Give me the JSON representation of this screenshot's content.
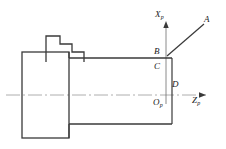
{
  "figure": {
    "background_color": "#ffffff",
    "line_color": "#3a3a3a",
    "centerline_color": "#9a9a9a",
    "text_color": "#1a1a1a"
  },
  "axes": {
    "vertical": {
      "name": "X_p",
      "letter": "X",
      "subscript": "p",
      "x": 166,
      "y_top": 22,
      "y_bottom": 104,
      "arrow": "up"
    },
    "horizontal": {
      "name": "Z_p",
      "letter": "Z",
      "subscript": "p",
      "y": 95,
      "x_left": 6,
      "x_right": 206,
      "arrow": "right"
    },
    "origin": {
      "name": "O_p",
      "letter": "O",
      "subscript": "p",
      "x": 166,
      "y": 95
    }
  },
  "points": [
    {
      "id": "A",
      "label": "A",
      "x": 205,
      "y": 23
    },
    {
      "id": "B",
      "label": "B",
      "x": 166,
      "y": 57
    },
    {
      "id": "C",
      "label": "C",
      "x": 166,
      "y": 66
    },
    {
      "id": "D",
      "label": "D",
      "x": 166,
      "y": 84
    }
  ],
  "labels": {
    "axis_x": {
      "letter": "X",
      "subscript": "p",
      "left": 155,
      "top": 10
    },
    "axis_z": {
      "letter": "Z",
      "subscript": "p",
      "left": 192,
      "top": 96
    },
    "origin": {
      "letter": "O",
      "subscript": "p",
      "left": 153,
      "top": 98
    },
    "point_a": {
      "text": "A",
      "left": 204,
      "top": 15
    },
    "point_b": {
      "text": "B",
      "left": 154,
      "top": 47
    },
    "point_c": {
      "text": "C",
      "left": 154,
      "top": 62
    },
    "point_d": {
      "text": "D",
      "left": 172,
      "top": 80
    }
  },
  "geometry": {
    "chuck": {
      "name": "chuck-body",
      "x": 22,
      "y": 52,
      "width": 47,
      "height": 86
    },
    "workpiece": {
      "name": "workpiece-bar",
      "x_left": 69,
      "x_right": 172,
      "y_top": 58,
      "y_bottom": 124
    },
    "tool": {
      "name": "stepped-cutting-tool",
      "points": "46,62 46,36 60,36 60,44 72,44 72,52 84,52 84,62"
    },
    "tool_path": {
      "name": "rapid-traverse-line",
      "from": "B",
      "to": "A",
      "x1": 167,
      "y1": 56,
      "x2": 204,
      "y2": 24
    },
    "centerline": {
      "name": "axis-centerline",
      "y": 95,
      "x_start": 6,
      "x_end": 206,
      "dash_pattern": "14 3 2 3"
    }
  }
}
